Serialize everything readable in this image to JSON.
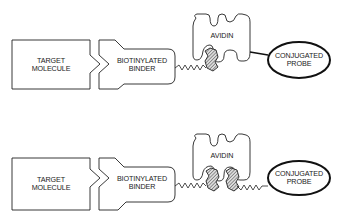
{
  "diagrams": [
    {
      "name": "single-biotin-complex",
      "target": {
        "line1": "TARGET",
        "line2": "MOLECULE"
      },
      "binder": {
        "line1": "BIOTINYLATED",
        "line2": "BINDER"
      },
      "avidin": {
        "label": "AVIDIN"
      },
      "probe": {
        "line1": "CONJUGATED",
        "line2": "PROBE"
      },
      "probe_link": "direct"
    },
    {
      "name": "double-biotin-complex",
      "target": {
        "line1": "TARGET",
        "line2": "MOLECULE"
      },
      "binder": {
        "line1": "BIOTINYLATED",
        "line2": "BINDER"
      },
      "avidin": {
        "label": "AVIDIN"
      },
      "probe": {
        "line1": "CONJUGATED",
        "line2": "PROBE"
      },
      "probe_link": "biotinylated"
    }
  ],
  "colors": {
    "stroke": "#222222",
    "background": "#ffffff"
  }
}
